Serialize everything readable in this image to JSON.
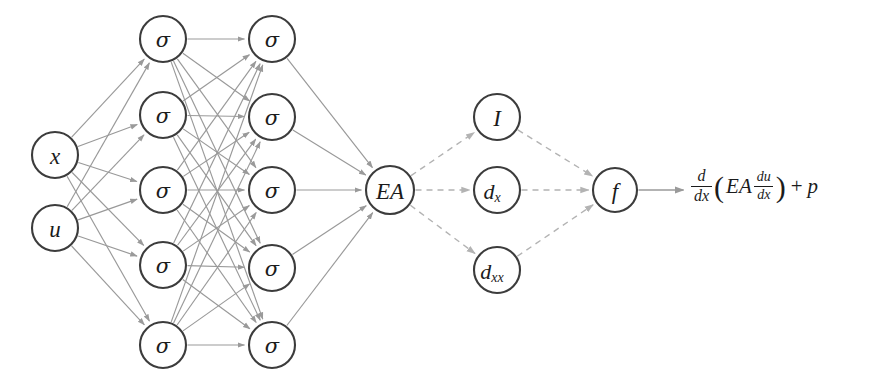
{
  "diagram": {
    "type": "neural-network-pinn",
    "background_color": "#ffffff",
    "node_stroke_color": "#3c3c3c",
    "solid_edge_color": "#999999",
    "dashed_edge_color": "#b3b3b3",
    "layers": [
      {
        "name": "input-layer",
        "x": 55,
        "style": "solid",
        "nodes": [
          {
            "id": "in-x",
            "label": "x",
            "kind": "roman",
            "cx": 55,
            "cy": 155,
            "r": 23
          },
          {
            "id": "in-u",
            "label": "u",
            "kind": "roman",
            "cx": 55,
            "cy": 228,
            "r": 23
          }
        ]
      },
      {
        "name": "hidden-layer-1",
        "x": 163,
        "style": "solid",
        "nodes": [
          {
            "id": "h1-1",
            "label": "σ",
            "kind": "greek",
            "cx": 163,
            "cy": 39,
            "r": 23
          },
          {
            "id": "h1-2",
            "label": "σ",
            "kind": "greek",
            "cx": 163,
            "cy": 115,
            "r": 23
          },
          {
            "id": "h1-3",
            "label": "σ",
            "kind": "greek",
            "cx": 163,
            "cy": 190,
            "r": 23
          },
          {
            "id": "h1-4",
            "label": "σ",
            "kind": "greek",
            "cx": 163,
            "cy": 265,
            "r": 23
          },
          {
            "id": "h1-5",
            "label": "σ",
            "kind": "greek",
            "cx": 163,
            "cy": 345,
            "r": 23
          }
        ]
      },
      {
        "name": "hidden-layer-2",
        "x": 272,
        "style": "solid",
        "nodes": [
          {
            "id": "h2-1",
            "label": "σ",
            "kind": "greek",
            "cx": 272,
            "cy": 39,
            "r": 23
          },
          {
            "id": "h2-2",
            "label": "σ",
            "kind": "greek",
            "cx": 272,
            "cy": 117,
            "r": 23
          },
          {
            "id": "h2-3",
            "label": "σ",
            "kind": "greek",
            "cx": 272,
            "cy": 190,
            "r": 23
          },
          {
            "id": "h2-4",
            "label": "σ",
            "kind": "greek",
            "cx": 272,
            "cy": 268,
            "r": 23
          },
          {
            "id": "h2-5",
            "label": "σ",
            "kind": "greek",
            "cx": 272,
            "cy": 345,
            "r": 23
          }
        ]
      },
      {
        "name": "output-layer",
        "x": 390,
        "style": "solid",
        "nodes": [
          {
            "id": "out-ea",
            "label": "EA",
            "kind": "roman",
            "cx": 390,
            "cy": 190,
            "r": 24
          }
        ]
      },
      {
        "name": "derivative-layer",
        "x": 497,
        "style": "dashed",
        "nodes": [
          {
            "id": "der-i",
            "label": "I",
            "kind": "roman",
            "cx": 497,
            "cy": 117,
            "r": 23
          },
          {
            "id": "der-dx",
            "label": "d",
            "sublabel": "x",
            "kind": "sub",
            "cx": 497,
            "cy": 190,
            "r": 23
          },
          {
            "id": "der-dxx",
            "label": "d",
            "sublabel": "xx",
            "kind": "sub",
            "cx": 497,
            "cy": 270,
            "r": 23
          }
        ]
      },
      {
        "name": "residual-layer",
        "x": 615,
        "style": "dashed",
        "nodes": [
          {
            "id": "res-f",
            "label": "f",
            "kind": "roman",
            "cx": 615,
            "cy": 190,
            "r": 22
          }
        ]
      }
    ],
    "edge_groups": [
      {
        "name": "input-to-hidden1",
        "from": [
          "in-x",
          "in-u"
        ],
        "to": [
          "h1-1",
          "h1-2",
          "h1-3",
          "h1-4",
          "h1-5"
        ],
        "style": "solid"
      },
      {
        "name": "hidden1-to-hidden2",
        "from": [
          "h1-1",
          "h1-2",
          "h1-3",
          "h1-4",
          "h1-5"
        ],
        "to": [
          "h2-1",
          "h2-2",
          "h2-3",
          "h2-4",
          "h2-5"
        ],
        "style": "solid"
      },
      {
        "name": "hidden2-to-output",
        "from": [
          "h2-1",
          "h2-2",
          "h2-3",
          "h2-4",
          "h2-5"
        ],
        "to": [
          "out-ea"
        ],
        "style": "solid"
      },
      {
        "name": "output-to-derivatives",
        "from": [
          "out-ea"
        ],
        "to": [
          "der-i",
          "der-dx",
          "der-dxx"
        ],
        "style": "dashed"
      },
      {
        "name": "derivatives-to-residual",
        "from": [
          "der-i",
          "der-dx",
          "der-dxx"
        ],
        "to": [
          "res-f"
        ],
        "style": "dashed"
      },
      {
        "name": "residual-to-formula",
        "from": [
          "res-f"
        ],
        "to": [
          "formula"
        ],
        "style": "solid"
      }
    ],
    "formula": {
      "name": "governing-equation",
      "text": "d/dx(EA du/dx) + p",
      "outer_frac_num": "d",
      "outer_frac_den": "dx",
      "open_paren": "(",
      "coefficient": "EA",
      "inner_frac_num": "du",
      "inner_frac_den": "dx",
      "close_paren": ")",
      "plus": "+",
      "source_term": "p"
    }
  }
}
